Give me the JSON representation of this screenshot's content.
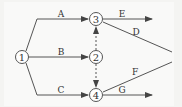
{
  "diagram": {
    "type": "network-diagram",
    "colors": {
      "line": "#555555",
      "text": "#333333",
      "node_fill": "#ffffff"
    },
    "nodes": [
      {
        "id": "1",
        "label": "1",
        "x": 22,
        "y": 57
      },
      {
        "id": "2",
        "label": "2",
        "x": 96,
        "y": 57
      },
      {
        "id": "3",
        "label": "3",
        "x": 96,
        "y": 19
      },
      {
        "id": "4",
        "label": "4",
        "x": 96,
        "y": 95
      }
    ],
    "edges": [
      {
        "id": "A",
        "label": "A",
        "from": "1",
        "to": "3",
        "style": "solid"
      },
      {
        "id": "B",
        "label": "B",
        "from": "1",
        "to": "2",
        "style": "solid"
      },
      {
        "id": "C",
        "label": "C",
        "from": "1",
        "to": "4",
        "style": "solid"
      },
      {
        "id": "dummy-2-3",
        "label": "",
        "from": "2",
        "to": "3",
        "style": "dashed"
      },
      {
        "id": "dummy-2-4",
        "label": "",
        "from": "2",
        "to": "4",
        "style": "dashed"
      },
      {
        "id": "E",
        "label": "E",
        "from": "3",
        "to": "",
        "style": "solid"
      },
      {
        "id": "D",
        "label": "D",
        "from": "3",
        "to": "",
        "style": "solid"
      },
      {
        "id": "F",
        "label": "F",
        "from": "4",
        "to": "",
        "style": "solid"
      },
      {
        "id": "G",
        "label": "G",
        "from": "4",
        "to": "",
        "style": "solid"
      }
    ]
  }
}
